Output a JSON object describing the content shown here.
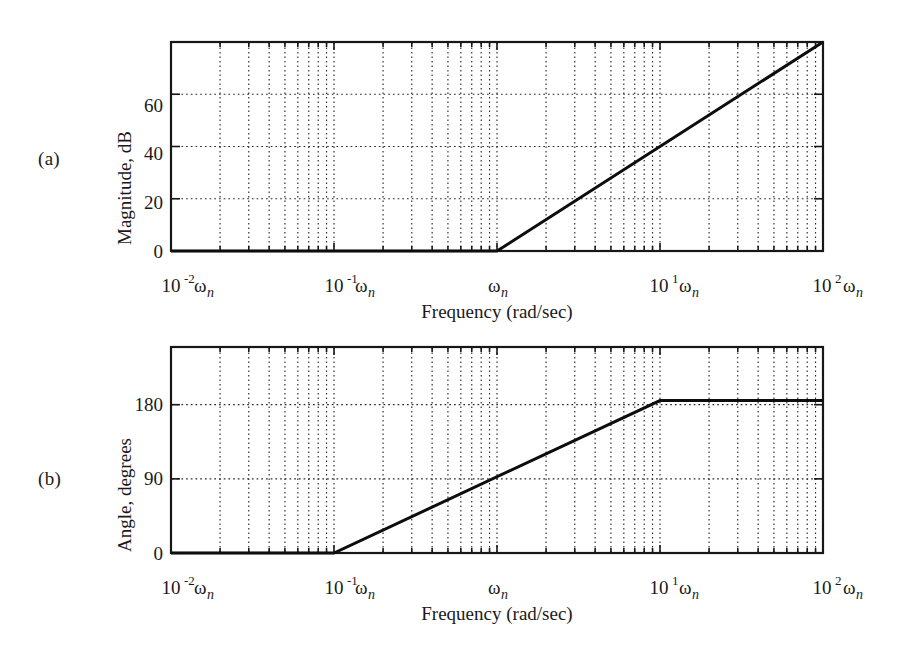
{
  "figure": {
    "panels": [
      {
        "id": "a",
        "label": "(a)"
      },
      {
        "id": "b",
        "label": "(b)"
      }
    ]
  },
  "magnitude_plot": {
    "panel_label": "(a)",
    "ylabel": "Magnitude, dB",
    "xlabel": "Frequency (rad/sec)",
    "y_ticks": [
      "0",
      "20",
      "40",
      "60"
    ],
    "x_tick_labels": [
      {
        "mantissa": "10",
        "exponent": "-2",
        "unit": "ω",
        "sub": "n"
      },
      {
        "mantissa": "10",
        "exponent": "-1",
        "unit": "ω",
        "sub": "n"
      },
      {
        "mantissa": "",
        "exponent": "",
        "unit": "ω",
        "sub": "n"
      },
      {
        "mantissa": "10",
        "exponent": "1",
        "unit": "ω",
        "sub": "n"
      },
      {
        "mantissa": "10",
        "exponent": "2",
        "unit": "ω",
        "sub": "n"
      }
    ]
  },
  "phase_plot": {
    "panel_label": "(b)",
    "ylabel": "Angle, degrees",
    "xlabel": "Frequency (rad/sec)",
    "y_ticks": [
      "0",
      "90",
      "180"
    ],
    "x_tick_labels": [
      {
        "mantissa": "10",
        "exponent": "-2",
        "unit": "ω",
        "sub": "n"
      },
      {
        "mantissa": "10",
        "exponent": "-1",
        "unit": "ω",
        "sub": "n"
      },
      {
        "mantissa": "",
        "exponent": "",
        "unit": "ω",
        "sub": "n"
      },
      {
        "mantissa": "10",
        "exponent": "1",
        "unit": "ω",
        "sub": "n"
      },
      {
        "mantissa": "10",
        "exponent": "2",
        "unit": "ω",
        "sub": "n"
      }
    ]
  },
  "chart_data": [
    {
      "type": "line",
      "id": "magnitude",
      "title": "",
      "subtitle": "(a)",
      "xlabel": "Frequency (rad/sec)",
      "ylabel": "Magnitude, dB",
      "xscale": "log",
      "x_unit": "ωn",
      "xlim_decades": [
        -2,
        2
      ],
      "ylim": [
        0,
        80
      ],
      "ytick_values": [
        0,
        20,
        40,
        60
      ],
      "xtick_labels": [
        "10^-2 ωn",
        "10^-1 ωn",
        "ωn",
        "10^1 ωn",
        "10^2 ωn"
      ],
      "grid": true,
      "legend": "none",
      "series": [
        {
          "name": "Asymptotic magnitude",
          "comment": "Flat 0 dB until the break at ωn, then +40 dB/decade",
          "points": [
            {
              "x_decade": -2,
              "y": 0
            },
            {
              "x_decade": 0,
              "y": 0
            },
            {
              "x_decade": 2,
              "y": 80
            }
          ]
        }
      ]
    },
    {
      "type": "line",
      "id": "phase",
      "title": "",
      "subtitle": "(b)",
      "xlabel": "Frequency (rad/sec)",
      "ylabel": "Angle, degrees",
      "xscale": "log",
      "x_unit": "ωn",
      "xlim_decades": [
        -2,
        2
      ],
      "ylim": [
        0,
        250
      ],
      "ytick_values": [
        0,
        90,
        180
      ],
      "xtick_labels": [
        "10^-2 ωn",
        "10^-1 ωn",
        "ωn",
        "10^1 ωn",
        "10^2 ωn"
      ],
      "grid": true,
      "legend": "none",
      "series": [
        {
          "name": "Asymptotic phase",
          "comment": "0 deg until 10^-1 ωn, ramps to 180 deg at 10^1 ωn, then flat",
          "points": [
            {
              "x_decade": -2,
              "y": 0
            },
            {
              "x_decade": -1,
              "y": 0
            },
            {
              "x_decade": 1,
              "y": 185
            },
            {
              "x_decade": 2,
              "y": 185
            }
          ]
        }
      ]
    }
  ]
}
